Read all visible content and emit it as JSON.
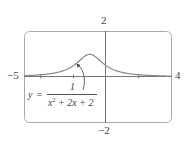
{
  "chart_data": {
    "type": "line",
    "title": "",
    "function": "y = 1/(x^2 + 2x + 2)",
    "series": [
      {
        "name": "y = 1/(x^2+2x+2)",
        "x": [
          -5,
          -4,
          -3,
          -2,
          -1.5,
          -1,
          -0.5,
          0,
          1,
          2,
          3,
          4
        ],
        "values": [
          0.0588,
          0.1,
          0.2,
          0.5,
          0.8,
          1.0,
          0.8,
          0.5,
          0.2,
          0.1,
          0.0588,
          0.0385
        ]
      }
    ],
    "xlim": [
      -5,
      4
    ],
    "ylim": [
      -2,
      2
    ],
    "xticks": [
      -4,
      -2,
      0,
      2
    ],
    "grid": false,
    "legend": "none",
    "xlabel": "",
    "ylabel": "",
    "color": "#888888"
  },
  "labels": {
    "x_min": "−5",
    "x_max": "4",
    "y_max": "2",
    "y_min": "−2"
  },
  "annotation": {
    "lhs": "y",
    "equals": "=",
    "numerator": "1",
    "denominator_x2": "x",
    "denominator_exp": "2",
    "denominator_rest": " + 2x + 2"
  }
}
